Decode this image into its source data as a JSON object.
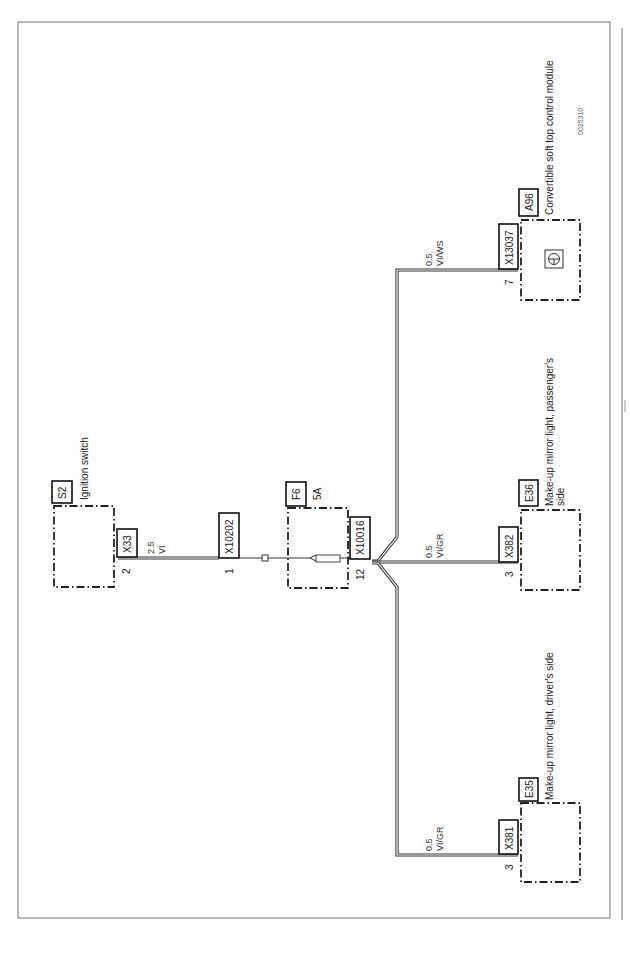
{
  "diagram": {
    "figure_id": "0025310",
    "orientation": "rotated-90-ccw",
    "components": [
      {
        "id": "S2",
        "name": "Ignition switch",
        "connector": "X33",
        "pin": "2"
      },
      {
        "id": "F6",
        "name": "5A",
        "connector_in": "X10202",
        "pin_in": "1",
        "connector_out": "X10016",
        "pin_out": "12"
      },
      {
        "id": "A96",
        "name": "Convertible soft top control module",
        "connector": "X13037",
        "pin": "7"
      },
      {
        "id": "E36",
        "name": "Make-up mirror light, passenger's side",
        "name_line1": "Make-up mirror light, passenger's",
        "name_line2": "side",
        "connector": "X382",
        "pin": "3"
      },
      {
        "id": "E35",
        "name": "Make-up mirror light, driver's side",
        "connector": "X381",
        "pin": "3"
      }
    ],
    "wires": [
      {
        "from": "X33",
        "to": "X10202",
        "size": "2.5",
        "color": "VI"
      },
      {
        "from": "X10016",
        "to": "X13037",
        "size": "0.5",
        "color": "VI/WS"
      },
      {
        "from": "X10016",
        "to": "X382",
        "size": "0.5",
        "color": "VI/GR"
      },
      {
        "from": "X10016",
        "to": "X381",
        "size": "0.5",
        "color": "VI/GR"
      }
    ]
  }
}
